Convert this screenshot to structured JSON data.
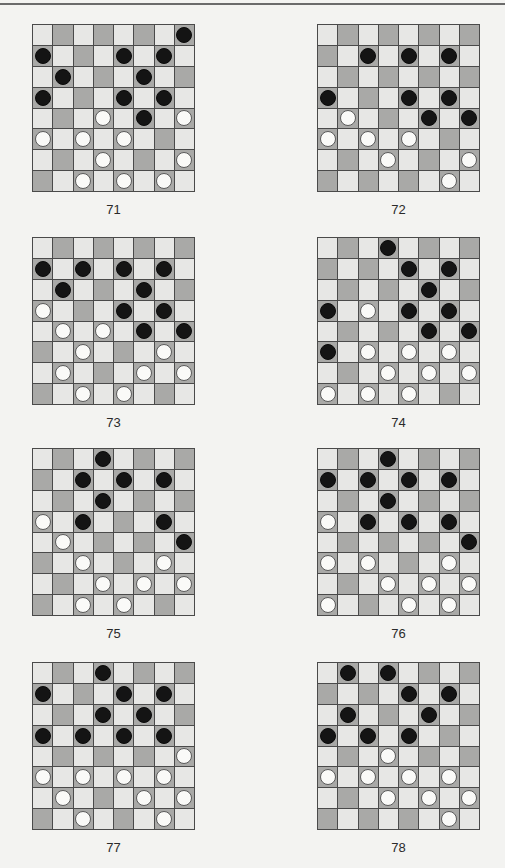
{
  "page": {
    "colors": {
      "background": "#f3f3f1",
      "light_square": "#e7e7e5",
      "dark_square": "#a9a9a7",
      "grid_line": "#4a4a4a",
      "black_piece": "#141414",
      "white_piece": "#fafaf8"
    },
    "board_size": 8,
    "dark_square_rule": "(row + col) is odd"
  },
  "diagrams": [
    {
      "label": "71",
      "left": 32,
      "top": 24,
      "black": [
        [
          0,
          7
        ],
        [
          1,
          0
        ],
        [
          1,
          4
        ],
        [
          1,
          6
        ],
        [
          2,
          1
        ],
        [
          2,
          5
        ],
        [
          3,
          0
        ],
        [
          3,
          4
        ],
        [
          3,
          6
        ],
        [
          4,
          5
        ]
      ],
      "white": [
        [
          4,
          3
        ],
        [
          4,
          7
        ],
        [
          5,
          0
        ],
        [
          5,
          2
        ],
        [
          5,
          4
        ],
        [
          6,
          3
        ],
        [
          6,
          7
        ],
        [
          7,
          2
        ],
        [
          7,
          4
        ],
        [
          7,
          6
        ]
      ]
    },
    {
      "label": "72",
      "left": 317,
      "top": 24,
      "black": [
        [
          1,
          2
        ],
        [
          1,
          4
        ],
        [
          1,
          6
        ],
        [
          3,
          0
        ],
        [
          3,
          4
        ],
        [
          3,
          6
        ],
        [
          4,
          5
        ],
        [
          4,
          7
        ]
      ],
      "white": [
        [
          4,
          1
        ],
        [
          5,
          0
        ],
        [
          5,
          2
        ],
        [
          5,
          4
        ],
        [
          6,
          3
        ],
        [
          6,
          7
        ],
        [
          7,
          6
        ]
      ]
    },
    {
      "label": "73",
      "left": 32,
      "top": 237,
      "black": [
        [
          1,
          0
        ],
        [
          1,
          2
        ],
        [
          1,
          4
        ],
        [
          1,
          6
        ],
        [
          2,
          1
        ],
        [
          2,
          5
        ],
        [
          3,
          4
        ],
        [
          3,
          6
        ],
        [
          4,
          5
        ],
        [
          4,
          7
        ]
      ],
      "white": [
        [
          3,
          0
        ],
        [
          4,
          1
        ],
        [
          4,
          3
        ],
        [
          5,
          2
        ],
        [
          5,
          6
        ],
        [
          6,
          1
        ],
        [
          6,
          5
        ],
        [
          6,
          7
        ],
        [
          7,
          2
        ],
        [
          7,
          4
        ]
      ]
    },
    {
      "label": "74",
      "left": 317,
      "top": 237,
      "black": [
        [
          0,
          3
        ],
        [
          1,
          4
        ],
        [
          1,
          6
        ],
        [
          2,
          5
        ],
        [
          3,
          0
        ],
        [
          3,
          4
        ],
        [
          3,
          6
        ],
        [
          4,
          5
        ],
        [
          4,
          7
        ],
        [
          5,
          0
        ]
      ],
      "white": [
        [
          3,
          2
        ],
        [
          5,
          2
        ],
        [
          5,
          4
        ],
        [
          5,
          6
        ],
        [
          6,
          3
        ],
        [
          6,
          5
        ],
        [
          6,
          7
        ],
        [
          7,
          0
        ],
        [
          7,
          2
        ],
        [
          7,
          4
        ]
      ]
    },
    {
      "label": "75",
      "left": 32,
      "top": 448,
      "black": [
        [
          0,
          3
        ],
        [
          1,
          2
        ],
        [
          1,
          4
        ],
        [
          1,
          6
        ],
        [
          2,
          3
        ],
        [
          3,
          2
        ],
        [
          3,
          6
        ],
        [
          4,
          7
        ]
      ],
      "white": [
        [
          3,
          0
        ],
        [
          4,
          1
        ],
        [
          5,
          2
        ],
        [
          5,
          6
        ],
        [
          6,
          3
        ],
        [
          6,
          5
        ],
        [
          6,
          7
        ],
        [
          7,
          2
        ],
        [
          7,
          4
        ]
      ]
    },
    {
      "label": "76",
      "left": 317,
      "top": 448,
      "black": [
        [
          0,
          3
        ],
        [
          1,
          0
        ],
        [
          1,
          2
        ],
        [
          1,
          4
        ],
        [
          1,
          6
        ],
        [
          2,
          3
        ],
        [
          3,
          2
        ],
        [
          3,
          4
        ],
        [
          3,
          6
        ],
        [
          4,
          7
        ]
      ],
      "white": [
        [
          3,
          0
        ],
        [
          5,
          0
        ],
        [
          5,
          2
        ],
        [
          5,
          6
        ],
        [
          6,
          3
        ],
        [
          6,
          5
        ],
        [
          6,
          7
        ],
        [
          7,
          0
        ],
        [
          7,
          4
        ],
        [
          7,
          6
        ]
      ]
    },
    {
      "label": "77",
      "left": 32,
      "top": 662,
      "black": [
        [
          0,
          3
        ],
        [
          1,
          0
        ],
        [
          1,
          4
        ],
        [
          1,
          6
        ],
        [
          2,
          3
        ],
        [
          2,
          5
        ],
        [
          3,
          0
        ],
        [
          3,
          2
        ],
        [
          3,
          4
        ],
        [
          3,
          6
        ]
      ],
      "white": [
        [
          4,
          7
        ],
        [
          5,
          0
        ],
        [
          5,
          2
        ],
        [
          5,
          4
        ],
        [
          5,
          6
        ],
        [
          6,
          1
        ],
        [
          6,
          5
        ],
        [
          6,
          7
        ],
        [
          7,
          2
        ],
        [
          7,
          6
        ]
      ]
    },
    {
      "label": "78",
      "left": 317,
      "top": 662,
      "black": [
        [
          0,
          1
        ],
        [
          0,
          3
        ],
        [
          1,
          4
        ],
        [
          1,
          6
        ],
        [
          2,
          1
        ],
        [
          2,
          5
        ],
        [
          3,
          0
        ],
        [
          3,
          2
        ],
        [
          3,
          4
        ]
      ],
      "white": [
        [
          4,
          3
        ],
        [
          5,
          0
        ],
        [
          5,
          2
        ],
        [
          5,
          4
        ],
        [
          5,
          6
        ],
        [
          6,
          3
        ],
        [
          6,
          5
        ],
        [
          6,
          7
        ],
        [
          7,
          6
        ]
      ]
    }
  ]
}
